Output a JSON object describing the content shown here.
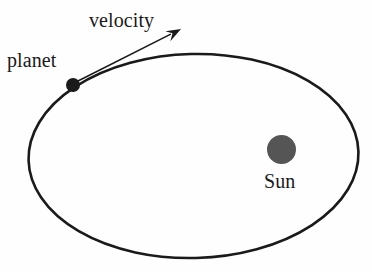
{
  "diagram": {
    "background_color": "#fefefe",
    "stroke_color": "#1a1a1a",
    "labels": {
      "velocity": "velocity",
      "planet": "planet",
      "sun": "Sun"
    },
    "icons": {
      "planet_dot": "planet-dot-icon",
      "sun_disc": "sun-disc-icon",
      "velocity_arrow": "velocity-arrow-icon",
      "orbit_path": "orbit-ellipse-icon"
    },
    "colors": {
      "orbit_stroke": "#1a1a1a",
      "planet_fill": "#1a1a1a",
      "sun_fill": "#555555",
      "arrow_stroke": "#1a1a1a",
      "text": "#1a1a1a"
    },
    "geometry": {
      "orbit_ellipse": {
        "cx": 193.5,
        "cy": 156,
        "rx": 165,
        "ry": 102,
        "rotation_deg": -1.5,
        "stroke_width": 2.6
      },
      "planet": {
        "cx": 73,
        "cy": 85,
        "r": 7
      },
      "sun": {
        "cx": 281.5,
        "cy": 149.5,
        "r": 14.5
      },
      "velocity_arrow": {
        "x1": 78,
        "y1": 81,
        "x2": 181,
        "y2": 29,
        "head_length": 15,
        "head_width": 9,
        "stroke_width": 1.6
      }
    }
  }
}
